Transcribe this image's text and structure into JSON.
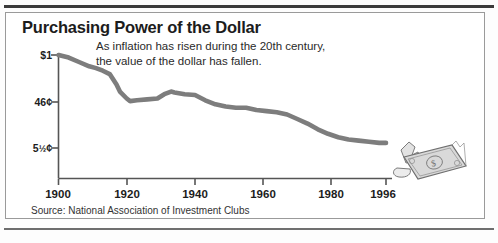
{
  "figure": {
    "title": "Purchasing Power of the Dollar",
    "subtitle_line1": "As inflation has risen during the 20th century,",
    "subtitle_line2": "the value of the dollar has fallen.",
    "source": "Source: National Association of Investment Clubs",
    "illustration": "torn-dollar-bill"
  },
  "colors": {
    "line": "#7d7d7d",
    "axis": "#555555",
    "text": "#1c1c1c",
    "rule": "#3b3b3b",
    "frame": "#9a9a9a",
    "bill_fill": "#d9d9d9",
    "bill_stroke": "#6f6f6f"
  },
  "chart_data": {
    "type": "line",
    "title": "Purchasing Power of the Dollar",
    "subtitle": "As inflation has risen during the 20th century, the value of the dollar has fallen.",
    "xlabel": "",
    "ylabel": "",
    "source": "Source: National Association of Investment Clubs",
    "grid": false,
    "legend": "none",
    "xlim": [
      1900,
      1996
    ],
    "ylim": [
      0,
      100
    ],
    "xtick_labels": [
      "1900",
      "1920",
      "1940",
      "1960",
      "1980",
      "1996"
    ],
    "xticks": [
      1900,
      1920,
      1940,
      1960,
      1980,
      1996
    ],
    "ytick_labels": [
      "$1",
      "46¢",
      "5½¢"
    ],
    "yticks": [
      100,
      46,
      5.5
    ],
    "series": [
      {
        "name": "Purchasing power of the dollar",
        "x": [
          1900,
          1903,
          1906,
          1909,
          1911,
          1913,
          1915,
          1917,
          1918,
          1920,
          1921,
          1923,
          1926,
          1929,
          1931,
          1933,
          1934,
          1937,
          1940,
          1943,
          1946,
          1949,
          1952,
          1955,
          1958,
          1961,
          1964,
          1967,
          1970,
          1973,
          1976,
          1979,
          1982,
          1985,
          1988,
          1991,
          1994,
          1996
        ],
        "values": [
          100,
          97,
          92,
          87,
          85,
          82,
          78,
          66,
          58,
          50,
          47,
          48,
          49,
          50,
          55,
          58,
          57,
          55,
          54,
          48,
          44,
          42,
          41,
          41,
          39,
          38,
          37,
          35,
          31,
          27,
          22,
          18,
          15,
          13,
          12,
          11,
          10,
          10
        ],
        "units": "cents of 1900 dollar"
      }
    ],
    "annotations": [
      {
        "text": "$1",
        "at_x": 1900,
        "at_y": 100
      },
      {
        "text": "46¢",
        "at_x": null,
        "at_y": 46
      },
      {
        "text": "5½¢",
        "at_x": null,
        "at_y": 5.5
      }
    ]
  }
}
